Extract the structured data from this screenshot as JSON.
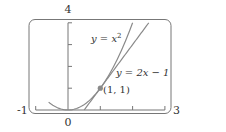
{
  "chart_data": {
    "type": "line",
    "title": "",
    "xlabel": "",
    "ylabel": "",
    "xlim": [
      -1,
      3
    ],
    "ylim": [
      0,
      4
    ],
    "x_tick_labels": [
      "-1",
      "0",
      "3"
    ],
    "y_tick_labels": [
      "4"
    ],
    "x_ticks": [
      -1,
      0,
      1,
      2,
      3
    ],
    "y_ticks": [
      0,
      1,
      2,
      3,
      4
    ],
    "grid": false,
    "series": [
      {
        "name": "y = x^2",
        "label": "y = x",
        "label_sup": "2",
        "function": "x^2",
        "x_range": [
          -0.6,
          2.0
        ],
        "color": "#8a8a8a"
      },
      {
        "name": "y = 2x - 1",
        "label": "y = 2x − 1",
        "function": "2x-1",
        "x_range": [
          0.5,
          2.5
        ],
        "color": "#8a8a8a"
      }
    ],
    "points": [
      {
        "x": 1,
        "y": 1,
        "label": "(1, 1)",
        "color": "#8a8a8a"
      }
    ],
    "annotations": [
      {
        "text": "y = x^2",
        "near_series": "y = x^2"
      },
      {
        "text": "y = 2x − 1",
        "near_series": "y = 2x - 1"
      },
      {
        "text": "(1, 1)",
        "near_point": [
          1,
          1
        ]
      }
    ]
  }
}
